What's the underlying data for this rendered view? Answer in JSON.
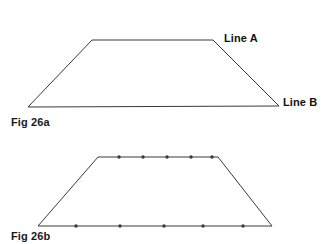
{
  "page": {
    "background_color": "#ffffff",
    "stroke_color": "#3a3a3a",
    "text_color": "#1a1a1a",
    "dot_color": "#3a3a3a"
  },
  "figures": [
    {
      "id": "fig-26a",
      "caption": "Fig 26a",
      "shape": "trapezoid",
      "vertices": {
        "bottom_left": [
          28,
          107
        ],
        "top_left": [
          92,
          40
        ],
        "top_right": [
          213,
          40
        ],
        "bottom_right": [
          279,
          106
        ]
      },
      "labels": [
        {
          "id": "line-a",
          "text": "Line A",
          "anchor": [
            213,
            40
          ]
        },
        {
          "id": "line-b",
          "text": "Line B",
          "anchor": [
            279,
            106
          ]
        }
      ],
      "markers": []
    },
    {
      "id": "fig-26b",
      "caption": "Fig 26b",
      "shape": "trapezoid",
      "vertices": {
        "bottom_left": [
          38,
          226
        ],
        "top_left": [
          98,
          157
        ],
        "top_right": [
          218,
          157
        ],
        "bottom_right": [
          272,
          226
        ]
      },
      "labels": [],
      "markers": {
        "top_line_dots": [
          [
            119,
            157
          ],
          [
            143,
            157
          ],
          [
            167,
            157
          ],
          [
            191,
            157
          ],
          [
            212,
            157
          ]
        ],
        "bottom_line_dots": [
          [
            76,
            226
          ],
          [
            120,
            226
          ],
          [
            164,
            226
          ],
          [
            203,
            226
          ],
          [
            243,
            226
          ]
        ],
        "dot_radius": 1.7
      }
    }
  ]
}
